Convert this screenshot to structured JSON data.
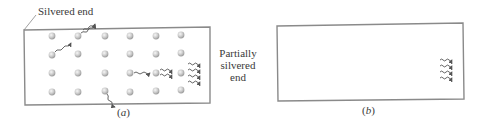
{
  "figure": {
    "panel_a": {
      "label_silvered": "Silvered end",
      "label_partial_line1": "Partially",
      "label_partial_line2": "silvered",
      "label_partial_line3": "end",
      "caption_open": "(",
      "caption_letter": "a",
      "caption_close": ")",
      "atom_grid": {
        "columns": [
          52,
          78,
          105,
          130,
          156,
          181
        ],
        "rows": [
          36,
          54,
          73,
          92
        ]
      }
    },
    "panel_b": {
      "caption_open": "(",
      "caption_letter": "b",
      "caption_close": ")"
    },
    "colors": {
      "frame": "#8a8a8a",
      "atom_fill": "#cfcfcf",
      "atom_highlight": "#f4f4f4",
      "photon": "#555555",
      "text": "#3a3a3a"
    }
  }
}
